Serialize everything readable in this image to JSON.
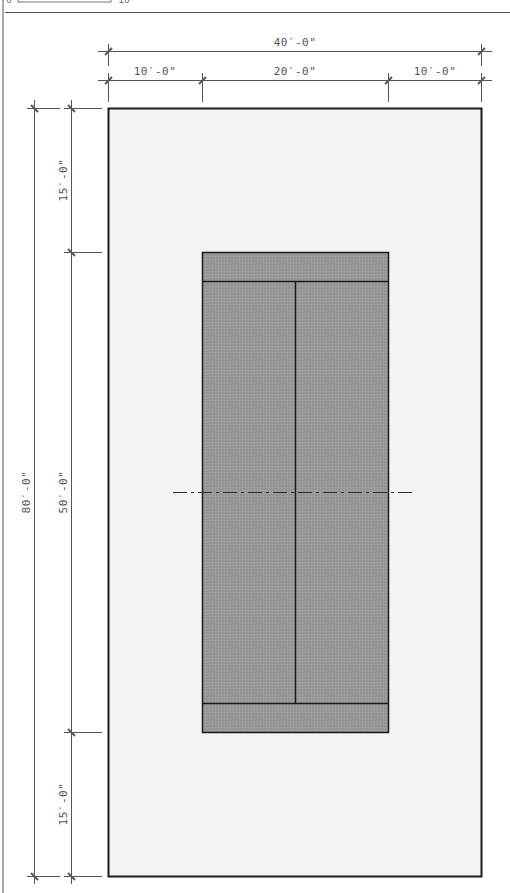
{
  "drawing": {
    "type": "court-plan",
    "colors": {
      "background": "#ffffff",
      "surround_fill": "#f3f3f3",
      "court_fill": "#9a9a9a",
      "court_stroke": "#1a1a1a",
      "dim_line": "#555555",
      "dim_text": "#555555"
    },
    "scale_bar": {
      "start_label": "0",
      "end_label": "10"
    },
    "dimensions": {
      "top_overall": "40′-0\"",
      "top_left": "10′-0\"",
      "top_middle": "20′-0\"",
      "top_right": "10′-0\"",
      "left_overall": "80′-0\"",
      "left_top": "15′-0\"",
      "left_middle": "50′-0\"",
      "left_bottom": "15′-0\""
    },
    "elements": {
      "surround": "paved-surround-area",
      "court": "playing-court",
      "center_line": "center-service-line",
      "net_line": "net-line-dashed",
      "service_line_top": "service-line-top",
      "service_line_bottom": "service-line-bottom"
    }
  }
}
